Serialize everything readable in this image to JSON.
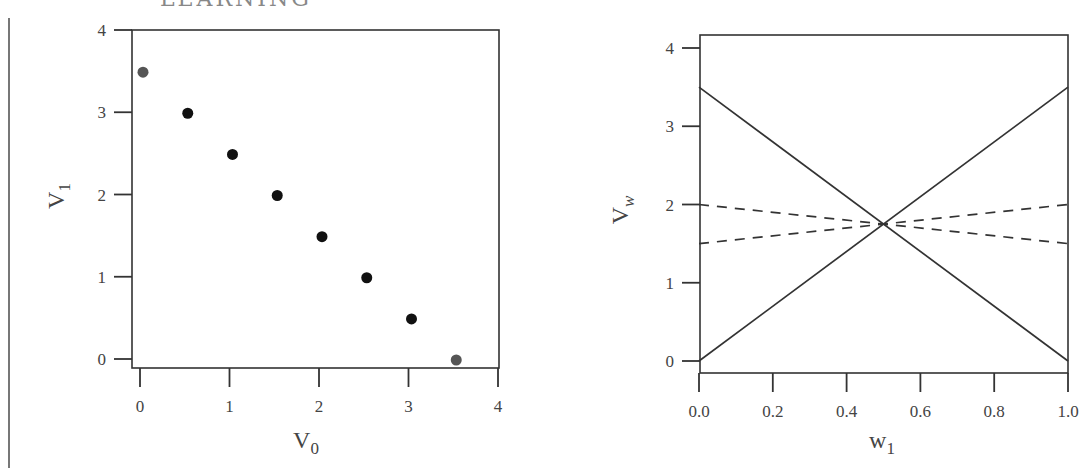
{
  "page": {
    "header_fragment": "· · · · · LEARNING"
  },
  "chart_data": [
    {
      "type": "scatter",
      "title": "",
      "xlabel": "V0",
      "ylabel": "V1",
      "xlabel_main": "V",
      "xlabel_sub": "0",
      "ylabel_main": "V",
      "ylabel_sub": "1",
      "xlim": [
        0,
        4
      ],
      "ylim": [
        0,
        4
      ],
      "x_ticks": [
        "0",
        "1",
        "2",
        "3",
        "4"
      ],
      "y_ticks": [
        "0",
        "1",
        "2",
        "3",
        "4"
      ],
      "grid": false,
      "legend": null,
      "points": [
        {
          "x": 0.0,
          "y": 3.5,
          "color": "#555555"
        },
        {
          "x": 0.5,
          "y": 3.0,
          "color": "#111111"
        },
        {
          "x": 1.0,
          "y": 2.5,
          "color": "#111111"
        },
        {
          "x": 1.5,
          "y": 2.0,
          "color": "#111111"
        },
        {
          "x": 2.0,
          "y": 1.5,
          "color": "#111111"
        },
        {
          "x": 2.5,
          "y": 1.0,
          "color": "#111111"
        },
        {
          "x": 3.0,
          "y": 0.5,
          "color": "#111111"
        },
        {
          "x": 3.5,
          "y": 0.0,
          "color": "#555555"
        }
      ]
    },
    {
      "type": "line",
      "title": "",
      "xlabel": "w1",
      "ylabel": "Vw",
      "xlabel_main": "w",
      "xlabel_sub": "1",
      "ylabel_main": "V",
      "ylabel_sub": "w",
      "xlim": [
        0,
        1
      ],
      "ylim": [
        0,
        4
      ],
      "x_ticks": [
        "0.0",
        "0.2",
        "0.4",
        "0.6",
        "0.8",
        "1.0"
      ],
      "y_ticks": [
        "0",
        "1",
        "2",
        "3",
        "4"
      ],
      "grid": false,
      "legend": null,
      "series": [
        {
          "name": "solid-decreasing",
          "style": "solid",
          "x": [
            0.0,
            1.0
          ],
          "y": [
            3.5,
            0.0
          ]
        },
        {
          "name": "solid-increasing",
          "style": "solid",
          "x": [
            0.0,
            1.0
          ],
          "y": [
            0.0,
            3.5
          ]
        },
        {
          "name": "dashed-decreasing",
          "style": "dashed",
          "x": [
            0.0,
            1.0
          ],
          "y": [
            2.0,
            1.5
          ]
        },
        {
          "name": "dashed-increasing",
          "style": "dashed",
          "x": [
            0.0,
            1.0
          ],
          "y": [
            1.5,
            2.0
          ]
        }
      ],
      "intersection": {
        "x": 0.5,
        "y": 1.75
      }
    }
  ]
}
